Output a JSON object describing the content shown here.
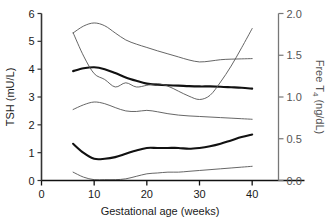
{
  "chart_data": {
    "type": "line",
    "title": "",
    "xlabel": "Gestational age (weeks)",
    "ylabel": "TSH (mU/L)",
    "y2label_main": "Free T",
    "y2label_sub": "4",
    "y2label_unit": " (ng/dL)",
    "xlim": [
      0,
      45
    ],
    "ylim": [
      0,
      6
    ],
    "y2lim": [
      0.0,
      2.0
    ],
    "grid": false,
    "legend": "none",
    "xticks": [
      "0",
      "10",
      "20",
      "30",
      "40"
    ],
    "xtick_values": [
      0,
      10,
      20,
      30,
      40
    ],
    "yticks": [
      "0",
      "1",
      "2",
      "3",
      "4",
      "5",
      "6"
    ],
    "ytick_values": [
      0,
      1,
      2,
      3,
      4,
      5,
      6
    ],
    "y2ticks": [
      "0.0",
      "0.5",
      "1.0",
      "1.5",
      "2.0"
    ],
    "y2tick_values": [
      0.0,
      0.5,
      1.0,
      1.5,
      2.0
    ],
    "series": [
      {
        "name": "TSH 97.5th percentile",
        "axis": "left",
        "style": "thin",
        "color": "#555555",
        "x": [
          6,
          8,
          10,
          12,
          14,
          16,
          18,
          20,
          22,
          24,
          26,
          28,
          30,
          32,
          34,
          36,
          38,
          40
        ],
        "values": [
          5.3,
          5.55,
          5.66,
          5.56,
          5.3,
          5.05,
          4.9,
          4.78,
          4.66,
          4.55,
          4.44,
          4.33,
          4.26,
          4.29,
          4.34,
          4.36,
          4.37,
          4.38
        ]
      },
      {
        "name": "TSH median",
        "axis": "left",
        "style": "thick",
        "color": "#111111",
        "x": [
          6,
          8,
          10,
          12,
          14,
          16,
          18,
          20,
          22,
          24,
          26,
          28,
          30,
          32,
          34,
          36,
          38,
          40
        ],
        "values": [
          3.93,
          4.03,
          4.07,
          4.0,
          3.86,
          3.7,
          3.58,
          3.48,
          3.44,
          3.42,
          3.41,
          3.39,
          3.38,
          3.38,
          3.37,
          3.35,
          3.33,
          3.3
        ]
      },
      {
        "name": "TSH 2.5th percentile",
        "axis": "left",
        "style": "thin",
        "color": "#555555",
        "x": [
          6,
          8,
          10,
          12,
          14,
          16,
          18,
          20,
          22,
          24,
          26,
          28,
          30,
          32,
          34,
          36,
          38,
          40
        ],
        "values": [
          2.55,
          2.72,
          2.82,
          2.76,
          2.62,
          2.5,
          2.48,
          2.52,
          2.47,
          2.4,
          2.35,
          2.32,
          2.3,
          2.28,
          2.26,
          2.24,
          2.22,
          2.2
        ]
      },
      {
        "name": "Free T4 97.5th percentile",
        "axis": "right",
        "style": "thin",
        "color": "#555555",
        "x": [
          6,
          8,
          10,
          12,
          14,
          16,
          18,
          20,
          22,
          24,
          26,
          28,
          30,
          32,
          34,
          36,
          38,
          40
        ],
        "values": [
          1.77,
          1.49,
          1.28,
          1.21,
          1.12,
          1.17,
          1.12,
          1.14,
          1.16,
          1.13,
          1.07,
          1.01,
          0.97,
          1.02,
          1.18,
          1.37,
          1.59,
          1.82
        ]
      },
      {
        "name": "Free T4 median",
        "axis": "right",
        "style": "thick",
        "color": "#111111",
        "x": [
          6,
          8,
          10,
          12,
          14,
          16,
          18,
          20,
          22,
          24,
          26,
          28,
          30,
          32,
          34,
          36,
          38,
          40
        ],
        "values": [
          0.44,
          0.33,
          0.26,
          0.26,
          0.28,
          0.32,
          0.36,
          0.39,
          0.39,
          0.39,
          0.39,
          0.38,
          0.39,
          0.41,
          0.44,
          0.48,
          0.52,
          0.55
        ]
      },
      {
        "name": "Free T4 2.5th percentile",
        "axis": "right",
        "style": "thin",
        "color": "#555555",
        "x": [
          6,
          8,
          10,
          12,
          14,
          16,
          18,
          20,
          22,
          24,
          26,
          28,
          30,
          32,
          34,
          36,
          38,
          40
        ],
        "values": [
          0.1,
          0.04,
          0.01,
          0.01,
          0.01,
          0.02,
          0.05,
          0.08,
          0.09,
          0.1,
          0.1,
          0.11,
          0.12,
          0.13,
          0.14,
          0.15,
          0.16,
          0.17
        ]
      }
    ]
  }
}
